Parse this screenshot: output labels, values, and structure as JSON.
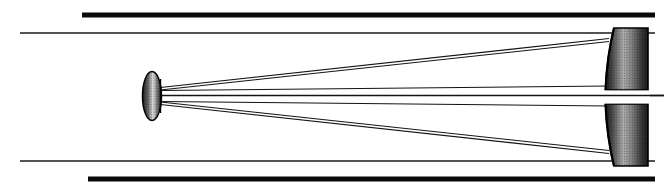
{
  "figure": {
    "caption": "",
    "width": 664,
    "height": 195,
    "background_color": "#ffffff",
    "ink_color": "#000000"
  },
  "diagram_data": {
    "type": "optical-ray-diagram",
    "instrument": "Cassegrain reflector telescope (cross-section)",
    "optical_axis": {
      "label": "",
      "y": 95,
      "x_start": 160,
      "x_end": 664
    },
    "tube": {
      "label": "telescope tube walls",
      "upper_thick_wall": {
        "x1": 82,
        "y1": 15,
        "x2": 655,
        "y2": 15,
        "thickness": 5,
        "color": "#0a0a0a"
      },
      "upper_thin_wall": {
        "x1": 20,
        "y1": 33,
        "x2": 655,
        "y2": 33,
        "thickness": 1.6,
        "color": "#1a1a1a"
      },
      "lower_thin_wall": {
        "x1": 20,
        "y1": 161,
        "x2": 655,
        "y2": 161,
        "thickness": 1.6,
        "color": "#1a1a1a"
      },
      "lower_thick_wall": {
        "x1": 88,
        "y1": 179,
        "x2": 655,
        "y2": 179,
        "thickness": 5,
        "color": "#0a0a0a"
      }
    },
    "primary_mirror": {
      "label": "primary concave mirror (perforated)",
      "position": "right",
      "x_front_vertex": 608,
      "x_back_edge": 648,
      "upper_segment": {
        "y_outer": 28,
        "y_inner": 90
      },
      "lower_segment": {
        "y_inner": 100,
        "y_outer": 166
      },
      "central_hole": {
        "y_top": 90,
        "y_bottom": 100
      },
      "fill": "stipple-gradient",
      "fill_dark": "#2b2b2b",
      "fill_light": "#c9c9c9"
    },
    "secondary_mirror": {
      "label": "secondary convex mirror",
      "position": "left-center",
      "center_x": 152,
      "center_y": 96,
      "radius_x": 9,
      "radius_y": 24,
      "fill": "oval-stipple",
      "fill_dark": "#333333",
      "fill_light": "#e8e8e8"
    },
    "rays": [
      {
        "name": "upper-outer-incoming",
        "x1": 160,
        "y1": 88,
        "x2": 608,
        "y2": 40
      },
      {
        "name": "upper-inner-incoming",
        "x1": 160,
        "y1": 91,
        "x2": 608,
        "y2": 86
      },
      {
        "name": "upper-reflected",
        "x1": 160,
        "y1": 89,
        "x2": 608,
        "y2": 42
      },
      {
        "name": "lower-outer-incoming",
        "x1": 160,
        "y1": 104,
        "x2": 608,
        "y2": 152
      },
      {
        "name": "lower-inner-incoming",
        "x1": 160,
        "y1": 101,
        "x2": 608,
        "y2": 106
      },
      {
        "name": "lower-reflected",
        "x1": 160,
        "y1": 103,
        "x2": 608,
        "y2": 150
      },
      {
        "name": "axial-exit",
        "x1": 160,
        "y1": 95,
        "x2": 664,
        "y2": 95
      }
    ],
    "ray_color": "#111111",
    "ray_width": 1.2
  }
}
